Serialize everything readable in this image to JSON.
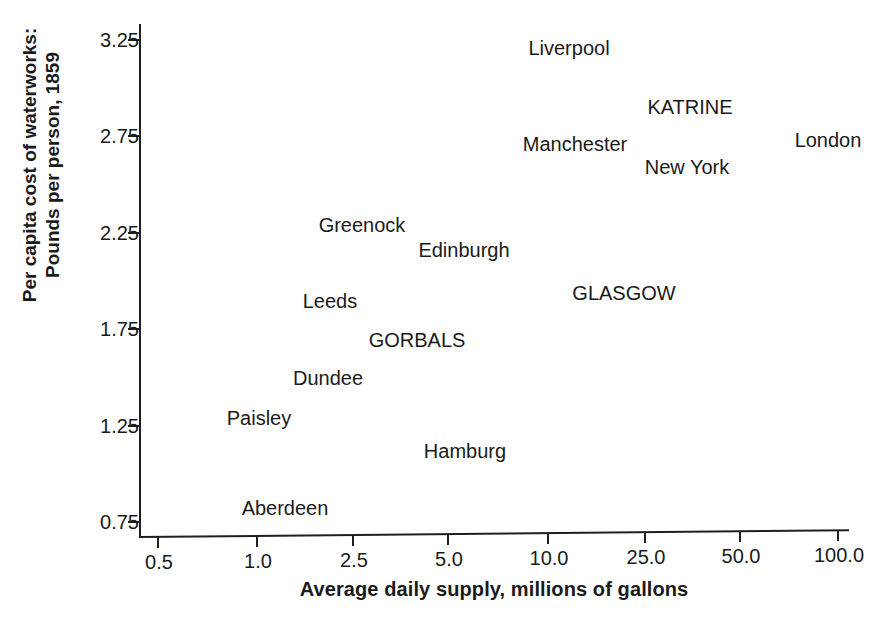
{
  "chart_data": {
    "type": "scatter",
    "title": "",
    "xlabel": "Average daily supply, millions of gallons",
    "ylabel": "Per capita cost of waterworks:\nPounds per person, 1859",
    "ylabel_lines": [
      "Per capita cost of waterworks:",
      "Pounds per person, 1859"
    ],
    "x_scale": "log",
    "xticks": [
      "0.5",
      "1.0",
      "2.5",
      "5.0",
      "10.0",
      "25.0",
      "50.0",
      "100.0"
    ],
    "xtick_values": [
      0.5,
      1.0,
      2.5,
      5.0,
      10.0,
      25.0,
      50.0,
      100.0
    ],
    "yticks": [
      "0.75",
      "1.25",
      "1.75",
      "2.25",
      "2.75",
      "3.25"
    ],
    "ytick_values": [
      0.75,
      1.25,
      1.75,
      2.25,
      2.75,
      3.25
    ],
    "ylim": [
      0.68,
      3.4
    ],
    "grid": false,
    "legend": false,
    "marker_style": "text-label-only",
    "points": [
      {
        "label": "Liverpool",
        "x": 8.0,
        "y": 3.18,
        "px": 569,
        "py": 48
      },
      {
        "label": "KATRINE",
        "x": 25.0,
        "y": 2.95,
        "px": 690,
        "py": 107
      },
      {
        "label": "Manchester",
        "x": 8.2,
        "y": 2.75,
        "px": 575,
        "py": 144
      },
      {
        "label": "London",
        "x": 76.0,
        "y": 2.77,
        "px": 828,
        "py": 140
      },
      {
        "label": "New York",
        "x": 24.5,
        "y": 2.62,
        "px": 687,
        "py": 167
      },
      {
        "label": "Greenock",
        "x": 3.2,
        "y": 2.29,
        "px": 362,
        "py": 225
      },
      {
        "label": "Edinburgh",
        "x": 5.6,
        "y": 2.14,
        "px": 464,
        "py": 250
      },
      {
        "label": "GLASGOW",
        "x": 16.5,
        "y": 1.92,
        "px": 624,
        "py": 293
      },
      {
        "label": "Leeds",
        "x": 2.3,
        "y": 1.88,
        "px": 330,
        "py": 301
      },
      {
        "label": "GORBALS",
        "x": 3.9,
        "y": 1.69,
        "px": 417,
        "py": 340
      },
      {
        "label": "Dundee",
        "x": 2.2,
        "y": 1.5,
        "px": 328,
        "py": 378
      },
      {
        "label": "Paisley",
        "x": 1.2,
        "y": 1.29,
        "px": 259,
        "py": 418
      },
      {
        "label": "Hamburg",
        "x": 5.9,
        "y": 1.11,
        "px": 465,
        "py": 451
      },
      {
        "label": "Aberdeen",
        "x": 1.45,
        "y": 0.82,
        "px": 285,
        "py": 508
      }
    ]
  },
  "axis": {
    "x_title": "Average daily supply, millions of gallons",
    "y_title_line1": "Per capita cost of waterworks:",
    "y_title_line2": "Pounds per person, 1859"
  }
}
